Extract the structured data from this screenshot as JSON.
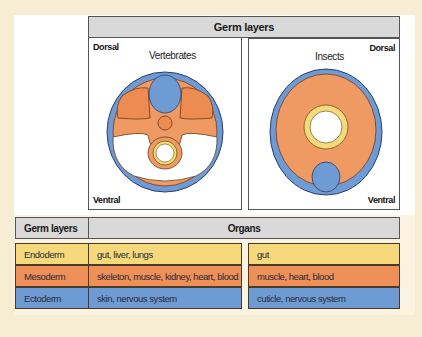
{
  "header": {
    "title": "Germ layers"
  },
  "panels": {
    "vertebrates": {
      "title": "Vertebrates",
      "dorsal": "Dorsal",
      "ventral": "Ventral"
    },
    "insects": {
      "title": "Insects",
      "dorsal": "Dorsal",
      "ventral": "Ventral"
    }
  },
  "colors": {
    "endoderm": "#f5d97a",
    "mesoderm": "#ee9058",
    "ectoderm": "#6f9bd4",
    "header_gray": "#d9d9d9",
    "background": "#f7edd4"
  },
  "table": {
    "headers": {
      "germ_layers": "Germ layers",
      "organs": "Organs"
    },
    "rows": [
      {
        "layer": "Endoderm",
        "vertebrates": "gut, liver, lungs",
        "insects": "gut"
      },
      {
        "layer": "Mesoderm",
        "vertebrates": "skeleton, muscle, kidney, heart, blood",
        "insects": "muscle, heart, blood"
      },
      {
        "layer": "Ectoderm",
        "vertebrates": "skin, nervous system",
        "insects": "cuticle, nervous system"
      }
    ]
  }
}
